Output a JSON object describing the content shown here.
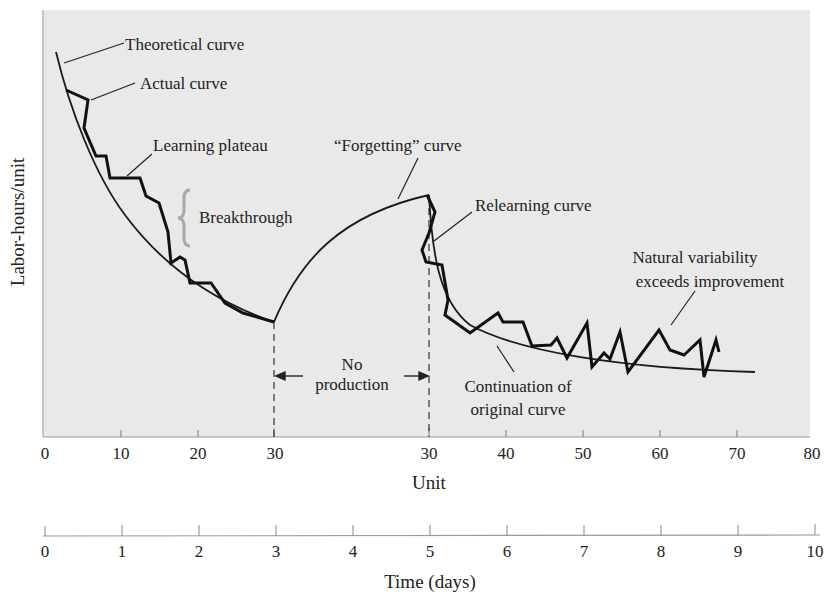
{
  "chart_data": {
    "type": "line",
    "title": "",
    "xlabel": "Unit",
    "x2label": "Time (days)",
    "ylabel": "Labor-hours/unit",
    "x_ticks": [
      "0",
      "10",
      "20",
      "30",
      "30",
      "40",
      "50",
      "60",
      "70",
      "80"
    ],
    "x2_ticks": [
      "0",
      "1",
      "2",
      "3",
      "4",
      "5",
      "6",
      "7",
      "8",
      "9",
      "10"
    ],
    "grid": false,
    "series": [
      {
        "name": "Theoretical curve",
        "style": "thin smooth"
      },
      {
        "name": "Actual curve",
        "style": "thick jagged"
      },
      {
        "name": "“Forgetting” curve",
        "style": "thin smooth rising"
      },
      {
        "name": "Relearning curve",
        "style": "thick jagged"
      },
      {
        "name": "Continuation of original curve",
        "style": "thin smooth"
      }
    ],
    "annotations": [
      "Theoretical curve",
      "Actual curve",
      "Learning plateau",
      "Breakthrough",
      "“Forgetting” curve",
      "Relearning curve",
      "Natural variability exceeds improvement",
      "No production",
      "Continuation of original curve"
    ]
  },
  "labels": {
    "theoretical": "Theoretical curve",
    "actual": "Actual curve",
    "plateau": "Learning plateau",
    "breakthrough": "Breakthrough",
    "forgetting": "“Forgetting” curve",
    "relearning": "Relearning curve",
    "natural1": "Natural variability",
    "natural2": "exceeds improvement",
    "noprod1": "No",
    "noprod2": "production",
    "cont1": "Continuation of",
    "cont2": "original curve",
    "xlabel": "Unit",
    "x2label": "Time (days)",
    "ylabel": "Labor-hours/unit"
  },
  "ticks": {
    "unit": [
      "0",
      "10",
      "20",
      "30",
      "30",
      "40",
      "50",
      "60",
      "70",
      "80"
    ],
    "days": [
      "0",
      "1",
      "2",
      "3",
      "4",
      "5",
      "6",
      "7",
      "8",
      "9",
      "10"
    ]
  },
  "colors": {
    "plot_bg": "#e9e9e9",
    "ink": "#1a1a1a",
    "brace": "#a8a8a8"
  }
}
